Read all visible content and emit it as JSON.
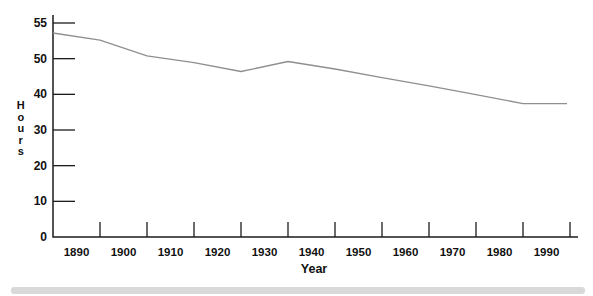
{
  "figure": {
    "background_color": "#ffffff",
    "divider_bar_color": "#d9d9d9"
  },
  "chart_data": {
    "type": "line",
    "title": "",
    "xlabel": "Year",
    "ylabel": "Hours",
    "x_tick_labels": [
      "1890",
      "1900",
      "1910",
      "1920",
      "1930",
      "1940",
      "1950",
      "1960",
      "1970",
      "1980",
      "1990"
    ],
    "y_tick_labels": [
      "0",
      "10",
      "20",
      "30",
      "40",
      "50",
      "55"
    ],
    "ylim": [
      0,
      55
    ],
    "grid": false,
    "legend": "none",
    "line_color": "#8f8f8f",
    "axis_color": "#1c1c1c",
    "text_color": "#111111",
    "categories": [
      "1890",
      "1900",
      "1910",
      "1920",
      "1930",
      "1940",
      "1950",
      "1960",
      "1970",
      "1980",
      "1990"
    ],
    "values": [
      53,
      51.5,
      49.5,
      47.5,
      48,
      48,
      46,
      43.5,
      41,
      38.5,
      37.5
    ],
    "line_vertex_hours": [
      53.6,
      52.6,
      50.4,
      48.9,
      46.4,
      49.2,
      47.1,
      44.7,
      42.4,
      39.9,
      37.4,
      37.4
    ]
  }
}
